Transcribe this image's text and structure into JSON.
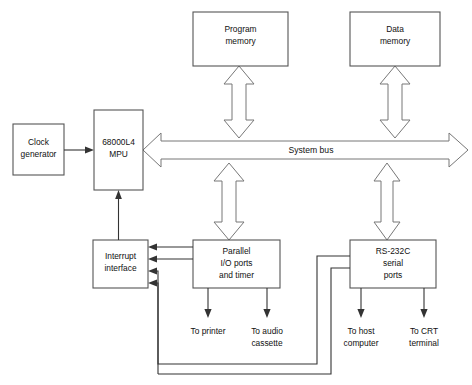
{
  "diagram": {
    "colors": {
      "background": "#ffffff",
      "box_stroke": "#555555",
      "bus_stroke": "#777777",
      "line_stroke": "#333333",
      "text": "#111111"
    },
    "blocks": [
      {
        "id": "clock-generator",
        "line1": "Clock",
        "line2": "generator",
        "line3": ""
      },
      {
        "id": "mpu",
        "line1": "68000L4",
        "line2": "MPU",
        "line3": ""
      },
      {
        "id": "program-memory",
        "line1": "Program",
        "line2": "memory",
        "line3": ""
      },
      {
        "id": "data-memory",
        "line1": "Data",
        "line2": "memory",
        "line3": ""
      },
      {
        "id": "interrupt-interface",
        "line1": "Interrupt",
        "line2": "interface",
        "line3": ""
      },
      {
        "id": "parallel-io",
        "line1": "Parallel",
        "line2": "I/O ports",
        "line3": "and timer"
      },
      {
        "id": "rs232c",
        "line1": "RS-232C",
        "line2": "serial",
        "line3": "ports"
      }
    ],
    "bus": {
      "label": "System bus"
    },
    "peripheral_labels": [
      {
        "id": "to-printer",
        "line1": "To printer",
        "line2": ""
      },
      {
        "id": "to-audio",
        "line1": "To audio",
        "line2": "cassette"
      },
      {
        "id": "to-host",
        "line1": "To host",
        "line2": "computer"
      },
      {
        "id": "to-crt",
        "line1": "To CRT",
        "line2": "terminal"
      }
    ]
  }
}
